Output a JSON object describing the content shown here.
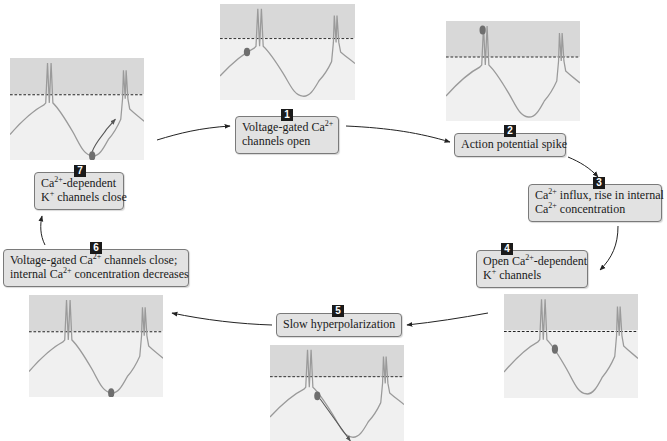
{
  "diagram": {
    "title": "",
    "colors": {
      "panel_background": "#f0f0f0",
      "panel_shaded_region": "#d8d8d8",
      "trace": "#9a9a9a",
      "marker_dot": "#6e6e6e",
      "threshold_line": "#222222",
      "box_fill": "#e2e2e2",
      "box_border": "#7a7a7a",
      "number_badge": "#1a1a1a"
    },
    "steps": [
      {
        "number": "1",
        "line1_pre": "Voltage-gated Ca",
        "line1_sup": "2+",
        "line1_post": "",
        "line2_pre": "channels open",
        "line2_sup": "",
        "line2_post": ""
      },
      {
        "number": "2",
        "line1_pre": "Action potential spike",
        "line1_sup": "",
        "line1_post": "",
        "line2_pre": "",
        "line2_sup": "",
        "line2_post": ""
      },
      {
        "number": "3",
        "line1_pre": "Ca",
        "line1_sup": "2+",
        "line1_post": " influx, rise in internal",
        "line2_pre": "Ca",
        "line2_sup": "2+",
        "line2_post": " concentration"
      },
      {
        "number": "4",
        "line1_pre": "Open Ca",
        "line1_sup": "2+",
        "line1_post": "-dependent",
        "line2_pre": "K",
        "line2_sup": "+",
        "line2_post": " channels"
      },
      {
        "number": "5",
        "line1_pre": "Slow hyperpolarization",
        "line1_sup": "",
        "line1_post": "",
        "line2_pre": "",
        "line2_sup": "",
        "line2_post": ""
      },
      {
        "number": "6",
        "line1_pre": "Voltage-gated Ca",
        "line1_sup": "2+",
        "line1_post": " channels close;",
        "line2_pre": "internal Ca",
        "line2_sup": "2+",
        "line2_post": " concentration decreases"
      },
      {
        "number": "7",
        "line1_pre": "Ca",
        "line1_sup": "2+",
        "line1_post": "-dependent",
        "line2_pre": "K",
        "line2_sup": "+",
        "line2_post": " channels close"
      }
    ],
    "panels": [
      {
        "id": "panel-step-1",
        "marker": "rising phase before first spike"
      },
      {
        "id": "panel-step-2",
        "marker": "peak of first spike"
      },
      {
        "id": "panel-step-4",
        "marker": "just after first spike"
      },
      {
        "id": "panel-step-5",
        "marker": "descending with arrow"
      },
      {
        "id": "panel-step-6",
        "marker": "trough"
      },
      {
        "id": "panel-step-7",
        "marker": "trough with rising arrow"
      }
    ]
  }
}
